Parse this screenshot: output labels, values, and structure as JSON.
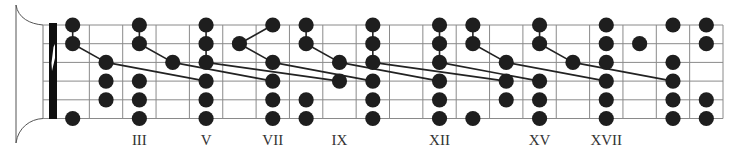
{
  "diagram": {
    "colors": {
      "background": "#ffffff",
      "grid": "#8a8a8a",
      "dot": "#1e1e1e",
      "connector": "#222222",
      "nut": "#0f0f0f",
      "headstock": "#555555",
      "label": "#333333"
    },
    "geometry": {
      "nut_x": 56,
      "fret_spacing": 33.35,
      "fret_count": 20,
      "string_y": [
        25,
        43.7,
        62.4,
        81.1,
        99.8,
        118.5
      ],
      "dot_radius": 7.6
    },
    "fret_markers": [
      {
        "fret": 3,
        "label": "III"
      },
      {
        "fret": 5,
        "label": "V"
      },
      {
        "fret": 7,
        "label": "VII"
      },
      {
        "fret": 9,
        "label": "IX"
      },
      {
        "fret": 12,
        "label": "XII"
      },
      {
        "fret": 15,
        "label": "XV"
      },
      {
        "fret": 17,
        "label": "XVII"
      }
    ],
    "dots": [
      {
        "fret": 1,
        "strings": [
          0,
          1,
          5
        ]
      },
      {
        "fret": 2,
        "strings": [
          2,
          3,
          4
        ]
      },
      {
        "fret": 3,
        "strings": [
          0,
          1,
          3,
          4,
          5
        ]
      },
      {
        "fret": 4,
        "strings": [
          2
        ]
      },
      {
        "fret": 5,
        "strings": [
          0,
          1,
          2,
          3,
          4,
          5
        ]
      },
      {
        "fret": 6,
        "strings": [
          1
        ]
      },
      {
        "fret": 7,
        "strings": [
          0,
          2,
          3,
          4,
          5
        ]
      },
      {
        "fret": 8,
        "strings": [
          0,
          1,
          4,
          5
        ]
      },
      {
        "fret": 9,
        "strings": [
          2,
          3
        ]
      },
      {
        "fret": 10,
        "strings": [
          0,
          1,
          2,
          3,
          4,
          5
        ]
      },
      {
        "fret": 12,
        "strings": [
          0,
          1,
          2,
          3,
          4,
          5
        ]
      },
      {
        "fret": 13,
        "strings": [
          0,
          1,
          5
        ]
      },
      {
        "fret": 14,
        "strings": [
          2,
          3,
          4
        ]
      },
      {
        "fret": 15,
        "strings": [
          0,
          1,
          3,
          4,
          5
        ]
      },
      {
        "fret": 16,
        "strings": [
          2
        ]
      },
      {
        "fret": 17,
        "strings": [
          0,
          1,
          2,
          3,
          4,
          5
        ]
      },
      {
        "fret": 18,
        "strings": [
          1
        ]
      },
      {
        "fret": 19,
        "strings": [
          0,
          2,
          3,
          4,
          5
        ]
      },
      {
        "fret": 20,
        "strings": [
          0,
          1,
          4,
          5
        ]
      }
    ],
    "connections": [
      [
        [
          1,
          0
        ],
        [
          1,
          1
        ]
      ],
      [
        [
          1,
          1
        ],
        [
          2,
          2
        ]
      ],
      [
        [
          2,
          2
        ],
        [
          5,
          3
        ]
      ],
      [
        [
          3,
          0
        ],
        [
          3,
          1
        ]
      ],
      [
        [
          3,
          1
        ],
        [
          4,
          2
        ]
      ],
      [
        [
          4,
          2
        ],
        [
          7,
          3
        ]
      ],
      [
        [
          5,
          0
        ],
        [
          5,
          1
        ]
      ],
      [
        [
          5,
          1
        ],
        [
          5,
          2
        ]
      ],
      [
        [
          5,
          2
        ],
        [
          9,
          3
        ]
      ],
      [
        [
          6,
          1
        ],
        [
          7,
          0
        ]
      ],
      [
        [
          6,
          1
        ],
        [
          7,
          2
        ]
      ],
      [
        [
          7,
          2
        ],
        [
          10,
          3
        ]
      ],
      [
        [
          8,
          0
        ],
        [
          8,
          1
        ]
      ],
      [
        [
          8,
          1
        ],
        [
          9,
          2
        ]
      ],
      [
        [
          9,
          2
        ],
        [
          12,
          3
        ]
      ],
      [
        [
          10,
          0
        ],
        [
          10,
          1
        ]
      ],
      [
        [
          10,
          1
        ],
        [
          10,
          2
        ]
      ],
      [
        [
          10,
          2
        ],
        [
          14,
          3
        ]
      ],
      [
        [
          12,
          0
        ],
        [
          12,
          1
        ]
      ],
      [
        [
          12,
          1
        ],
        [
          12,
          2
        ]
      ],
      [
        [
          12,
          2
        ],
        [
          15,
          3
        ]
      ],
      [
        [
          13,
          0
        ],
        [
          13,
          1
        ]
      ],
      [
        [
          13,
          1
        ],
        [
          14,
          2
        ]
      ],
      [
        [
          14,
          2
        ],
        [
          17,
          3
        ]
      ],
      [
        [
          15,
          0
        ],
        [
          15,
          1
        ]
      ],
      [
        [
          15,
          1
        ],
        [
          16,
          2
        ]
      ],
      [
        [
          16,
          2
        ],
        [
          19,
          3
        ]
      ]
    ]
  }
}
